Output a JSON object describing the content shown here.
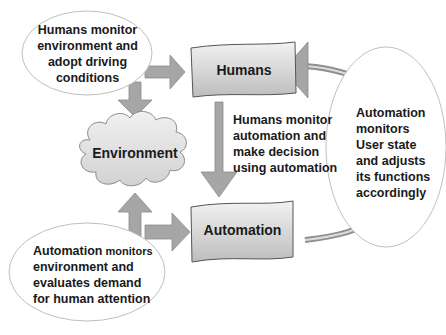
{
  "diagram": {
    "nodes": {
      "humans": {
        "label": "Humans"
      },
      "automation": {
        "label": "Automation"
      },
      "environment": {
        "label": "Environment"
      }
    },
    "callouts": {
      "top_left": {
        "lines": [
          "Humans monitor",
          "environment and",
          "adopt driving",
          "conditions"
        ]
      },
      "bottom_left": {
        "first_bold": "Automation",
        "first_rest": " monitors",
        "lines": [
          "environment and",
          "evaluates demand",
          "for human attention"
        ]
      },
      "right": {
        "lines": [
          "Automation",
          "monitors",
          "User state",
          "and adjusts",
          "its functions",
          "accordingly"
        ]
      }
    },
    "middle_text": {
      "lines": [
        "Humans monitor",
        "automation and",
        "make decision",
        "using automation"
      ]
    },
    "colors": {
      "arrow_fill": "#a6a6a6",
      "arrow_stroke": "#8a8a8a",
      "box_fill_light": "#ececec",
      "box_fill_dark": "#b8b8b8",
      "ellipse_stroke": "#bfbfbf",
      "text": "#1a1a1a"
    }
  }
}
